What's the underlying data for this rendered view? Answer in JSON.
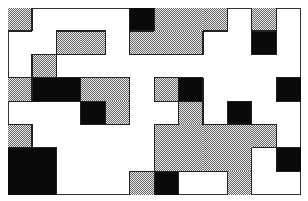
{
  "grid": {
    "cols": 12,
    "rows": 8,
    "origin": [
      8,
      8
    ],
    "size": [
      293,
      187
    ],
    "colors": {
      "gray": "#b0b0b0",
      "black": "#0a0a0a",
      "white": "#ffffff",
      "border": "#222222"
    },
    "cells": [
      [
        "gray",
        "white",
        "white",
        "white",
        "white",
        "black",
        "gray",
        "gray",
        "gray",
        "white",
        "gray",
        "white"
      ],
      [
        "white",
        "white",
        "gray",
        "gray",
        "white",
        "gray",
        "gray",
        "gray",
        "white",
        "white",
        "black",
        "white"
      ],
      [
        "white",
        "gray",
        "white",
        "white",
        "white",
        "white",
        "white",
        "white",
        "white",
        "white",
        "white",
        "white"
      ],
      [
        "gray",
        "black",
        "black",
        "gray",
        "gray",
        "white",
        "gray",
        "black",
        "white",
        "white",
        "white",
        "black"
      ],
      [
        "white",
        "white",
        "white",
        "black",
        "gray",
        "white",
        "white",
        "gray",
        "white",
        "black",
        "white",
        "white"
      ],
      [
        "gray",
        "white",
        "white",
        "white",
        "white",
        "white",
        "gray",
        "gray",
        "gray",
        "gray",
        "gray",
        "white"
      ],
      [
        "black",
        "black",
        "white",
        "white",
        "white",
        "white",
        "gray",
        "gray",
        "gray",
        "gray",
        "white",
        "black"
      ],
      [
        "black",
        "black",
        "white",
        "white",
        "white",
        "gray",
        "black",
        "white",
        "white",
        "gray",
        "white",
        "white"
      ]
    ]
  }
}
